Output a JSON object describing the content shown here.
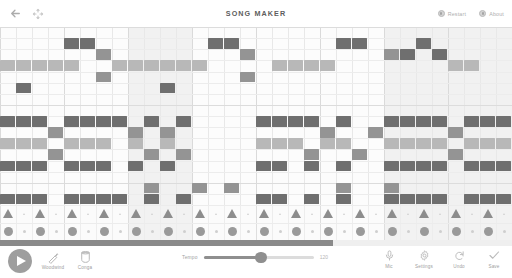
{
  "app": {
    "title": "SONG MAKER"
  },
  "header": {
    "back_icon": "back-arrow-icon",
    "fullscreen_icon": "fullscreen-expand-icon",
    "actions": [
      {
        "label": "Restart",
        "icon": "restart-icon"
      },
      {
        "label": "About",
        "icon": "about-info-icon"
      }
    ]
  },
  "toolbar": {
    "play_label": "Play",
    "instruments": [
      {
        "label": "Woodwind",
        "icon": "marimba-mallet-icon"
      },
      {
        "label": "Conga",
        "icon": "conga-drum-icon"
      }
    ],
    "tempo": {
      "label": "Tempo",
      "value": "120",
      "min": 40,
      "max": 240,
      "percent": 52
    },
    "actions": [
      {
        "label": "Mic",
        "icon": "microphone-icon"
      },
      {
        "label": "Settings",
        "icon": "gear-icon"
      },
      {
        "label": "Undo",
        "icon": "undo-arrow-icon"
      },
      {
        "label": "Save",
        "icon": "checkmark-icon"
      }
    ]
  },
  "sequencer": {
    "columns": 32,
    "melody_rows": 16,
    "percussion_rows": 2,
    "beats_per_bar": 4,
    "playhead_percent": 65,
    "highlighted_measures": [
      2,
      6,
      7
    ],
    "palette": {
      "dark": "#6f6f6f",
      "mid": "#949494",
      "light": "#b8b8b8",
      "pale": "#d6d6d6",
      "band": "#f1f1f1",
      "grid_line": "#e8e8e8",
      "bar_line": "#dadada"
    },
    "notes": [
      {
        "c": 4,
        "r": 1,
        "s": "dark"
      },
      {
        "c": 5,
        "r": 1,
        "s": "dark"
      },
      {
        "c": 6,
        "r": 2,
        "s": "mid"
      },
      {
        "c": 0,
        "r": 3,
        "s": "light"
      },
      {
        "c": 1,
        "r": 3,
        "s": "light"
      },
      {
        "c": 2,
        "r": 3,
        "s": "light"
      },
      {
        "c": 3,
        "r": 3,
        "s": "light"
      },
      {
        "c": 4,
        "r": 3,
        "s": "light"
      },
      {
        "c": 6,
        "r": 4,
        "s": "mid"
      },
      {
        "c": 1,
        "r": 5,
        "s": "dark"
      },
      {
        "c": 10,
        "r": 5,
        "s": "dark"
      },
      {
        "c": 13,
        "r": 1,
        "s": "dark"
      },
      {
        "c": 14,
        "r": 1,
        "s": "dark"
      },
      {
        "c": 15,
        "r": 2,
        "s": "mid"
      },
      {
        "c": 7,
        "r": 3,
        "s": "light"
      },
      {
        "c": 8,
        "r": 3,
        "s": "light"
      },
      {
        "c": 9,
        "r": 3,
        "s": "light"
      },
      {
        "c": 10,
        "r": 3,
        "s": "light"
      },
      {
        "c": 11,
        "r": 3,
        "s": "light"
      },
      {
        "c": 12,
        "r": 3,
        "s": "light"
      },
      {
        "c": 15,
        "r": 4,
        "s": "mid"
      },
      {
        "c": 21,
        "r": 1,
        "s": "dark"
      },
      {
        "c": 22,
        "r": 1,
        "s": "dark"
      },
      {
        "c": 24,
        "r": 2,
        "s": "mid"
      },
      {
        "c": 17,
        "r": 3,
        "s": "light"
      },
      {
        "c": 18,
        "r": 3,
        "s": "light"
      },
      {
        "c": 19,
        "r": 3,
        "s": "light"
      },
      {
        "c": 20,
        "r": 3,
        "s": "light"
      },
      {
        "c": 26,
        "r": 1,
        "s": "dark"
      },
      {
        "c": 25,
        "r": 2,
        "s": "dark"
      },
      {
        "c": 27,
        "r": 2,
        "s": "dark"
      },
      {
        "c": 28,
        "r": 3,
        "s": "light"
      },
      {
        "c": 29,
        "r": 3,
        "s": "light"
      },
      {
        "c": 0,
        "r": 8,
        "s": "dark"
      },
      {
        "c": 1,
        "r": 8,
        "s": "dark"
      },
      {
        "c": 2,
        "r": 8,
        "s": "dark"
      },
      {
        "c": 4,
        "r": 8,
        "s": "dark"
      },
      {
        "c": 5,
        "r": 8,
        "s": "dark"
      },
      {
        "c": 6,
        "r": 8,
        "s": "dark"
      },
      {
        "c": 7,
        "r": 8,
        "s": "dark"
      },
      {
        "c": 9,
        "r": 8,
        "s": "dark"
      },
      {
        "c": 11,
        "r": 8,
        "s": "dark"
      },
      {
        "c": 3,
        "r": 9,
        "s": "mid"
      },
      {
        "c": 8,
        "r": 9,
        "s": "mid"
      },
      {
        "c": 10,
        "r": 9,
        "s": "mid"
      },
      {
        "c": 0,
        "r": 10,
        "s": "light"
      },
      {
        "c": 1,
        "r": 10,
        "s": "light"
      },
      {
        "c": 2,
        "r": 10,
        "s": "light"
      },
      {
        "c": 4,
        "r": 10,
        "s": "light"
      },
      {
        "c": 5,
        "r": 10,
        "s": "light"
      },
      {
        "c": 6,
        "r": 10,
        "s": "light"
      },
      {
        "c": 8,
        "r": 10,
        "s": "light"
      },
      {
        "c": 10,
        "r": 10,
        "s": "light"
      },
      {
        "c": 3,
        "r": 11,
        "s": "mid"
      },
      {
        "c": 9,
        "r": 11,
        "s": "mid"
      },
      {
        "c": 11,
        "r": 11,
        "s": "mid"
      },
      {
        "c": 0,
        "r": 12,
        "s": "dark"
      },
      {
        "c": 1,
        "r": 12,
        "s": "dark"
      },
      {
        "c": 2,
        "r": 12,
        "s": "dark"
      },
      {
        "c": 4,
        "r": 12,
        "s": "dark"
      },
      {
        "c": 5,
        "r": 12,
        "s": "dark"
      },
      {
        "c": 6,
        "r": 12,
        "s": "dark"
      },
      {
        "c": 8,
        "r": 12,
        "s": "dark"
      },
      {
        "c": 10,
        "r": 12,
        "s": "dark"
      },
      {
        "c": 16,
        "r": 8,
        "s": "dark"
      },
      {
        "c": 17,
        "r": 8,
        "s": "dark"
      },
      {
        "c": 18,
        "r": 8,
        "s": "dark"
      },
      {
        "c": 19,
        "r": 8,
        "s": "dark"
      },
      {
        "c": 21,
        "r": 8,
        "s": "dark"
      },
      {
        "c": 20,
        "r": 9,
        "s": "mid"
      },
      {
        "c": 23,
        "r": 9,
        "s": "mid"
      },
      {
        "c": 16,
        "r": 10,
        "s": "light"
      },
      {
        "c": 17,
        "r": 10,
        "s": "light"
      },
      {
        "c": 18,
        "r": 10,
        "s": "light"
      },
      {
        "c": 20,
        "r": 10,
        "s": "light"
      },
      {
        "c": 21,
        "r": 10,
        "s": "light"
      },
      {
        "c": 19,
        "r": 11,
        "s": "mid"
      },
      {
        "c": 22,
        "r": 11,
        "s": "mid"
      },
      {
        "c": 16,
        "r": 12,
        "s": "dark"
      },
      {
        "c": 17,
        "r": 12,
        "s": "dark"
      },
      {
        "c": 19,
        "r": 12,
        "s": "dark"
      },
      {
        "c": 21,
        "r": 12,
        "s": "dark"
      },
      {
        "c": 24,
        "r": 8,
        "s": "dark"
      },
      {
        "c": 25,
        "r": 8,
        "s": "dark"
      },
      {
        "c": 26,
        "r": 8,
        "s": "dark"
      },
      {
        "c": 27,
        "r": 8,
        "s": "dark"
      },
      {
        "c": 29,
        "r": 8,
        "s": "dark"
      },
      {
        "c": 30,
        "r": 8,
        "s": "dark"
      },
      {
        "c": 31,
        "r": 8,
        "s": "dark"
      },
      {
        "c": 28,
        "r": 9,
        "s": "mid"
      },
      {
        "c": 24,
        "r": 10,
        "s": "light"
      },
      {
        "c": 25,
        "r": 10,
        "s": "light"
      },
      {
        "c": 26,
        "r": 10,
        "s": "light"
      },
      {
        "c": 27,
        "r": 10,
        "s": "light"
      },
      {
        "c": 29,
        "r": 10,
        "s": "light"
      },
      {
        "c": 30,
        "r": 10,
        "s": "light"
      },
      {
        "c": 31,
        "r": 10,
        "s": "light"
      },
      {
        "c": 28,
        "r": 11,
        "s": "mid"
      },
      {
        "c": 24,
        "r": 12,
        "s": "dark"
      },
      {
        "c": 25,
        "r": 12,
        "s": "dark"
      },
      {
        "c": 26,
        "r": 12,
        "s": "dark"
      },
      {
        "c": 27,
        "r": 12,
        "s": "dark"
      },
      {
        "c": 29,
        "r": 12,
        "s": "dark"
      },
      {
        "c": 30,
        "r": 12,
        "s": "dark"
      },
      {
        "c": 31,
        "r": 12,
        "s": "dark"
      },
      {
        "c": 9,
        "r": 14,
        "s": "mid"
      },
      {
        "c": 12,
        "r": 14,
        "s": "mid"
      },
      {
        "c": 14,
        "r": 14,
        "s": "mid"
      },
      {
        "c": 21,
        "r": 14,
        "s": "mid"
      },
      {
        "c": 24,
        "r": 14,
        "s": "mid"
      },
      {
        "c": 0,
        "r": 15,
        "s": "dark"
      },
      {
        "c": 1,
        "r": 15,
        "s": "dark"
      },
      {
        "c": 2,
        "r": 15,
        "s": "dark"
      },
      {
        "c": 4,
        "r": 15,
        "s": "dark"
      },
      {
        "c": 5,
        "r": 15,
        "s": "dark"
      },
      {
        "c": 6,
        "r": 15,
        "s": "dark"
      },
      {
        "c": 7,
        "r": 15,
        "s": "dark"
      },
      {
        "c": 9,
        "r": 15,
        "s": "dark"
      },
      {
        "c": 11,
        "r": 15,
        "s": "dark"
      },
      {
        "c": 16,
        "r": 15,
        "s": "dark"
      },
      {
        "c": 17,
        "r": 15,
        "s": "dark"
      },
      {
        "c": 19,
        "r": 15,
        "s": "dark"
      },
      {
        "c": 21,
        "r": 15,
        "s": "dark"
      },
      {
        "c": 24,
        "r": 15,
        "s": "dark"
      },
      {
        "c": 25,
        "r": 15,
        "s": "dark"
      },
      {
        "c": 26,
        "r": 15,
        "s": "dark"
      },
      {
        "c": 27,
        "r": 15,
        "s": "dark"
      },
      {
        "c": 29,
        "r": 15,
        "s": "dark"
      },
      {
        "c": 30,
        "r": 15,
        "s": "dark"
      },
      {
        "c": 31,
        "r": 15,
        "s": "dark"
      }
    ],
    "percussion": {
      "triangle_row": [
        0,
        2,
        4,
        6,
        8,
        10,
        12,
        14,
        16,
        18,
        20,
        22,
        24,
        26,
        28,
        30
      ],
      "circle_row": [
        0,
        2,
        4,
        6,
        8,
        10,
        12,
        14,
        16,
        18,
        20,
        22,
        24,
        26,
        28,
        30
      ]
    }
  }
}
